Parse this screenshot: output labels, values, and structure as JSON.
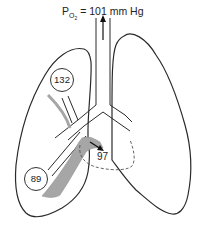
{
  "title": {
    "symbol": "P",
    "subscript": "O",
    "subsubscript": "2",
    "value_text": "= 101 mm Hg"
  },
  "labels": {
    "upper_vessel_value": "132",
    "lower_vessel_value": "89",
    "mixed_value": "97"
  },
  "colors": {
    "outline": "#2a2a2a",
    "vessel_fill": "#a6a6a6",
    "background": "#ffffff"
  }
}
